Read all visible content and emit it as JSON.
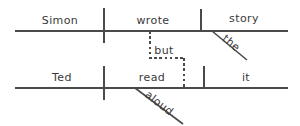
{
  "diagram": {
    "type": "reed-kellogg-sentence-diagram",
    "sentence": "Simon wrote the story but Ted read it aloud.",
    "ink_color": "#4a4a4a",
    "text_color": "#3a3a3a",
    "background_color": "#ffffff",
    "clauses": [
      {
        "id": "clause-top",
        "baseline": {
          "x1": 15,
          "x2": 288,
          "y": 31
        },
        "slots": [
          {
            "role": "subject",
            "label": "Simon",
            "x": 60,
            "y": 24
          },
          {
            "role": "verb",
            "label": "wrote",
            "x": 153,
            "y": 24
          },
          {
            "role": "direct-object",
            "label": "story",
            "x": 244,
            "y": 22
          }
        ],
        "modifiers": [
          {
            "role": "article",
            "label": "the",
            "attaches_to": "story",
            "x": 229,
            "y": 46,
            "rotation": 40
          }
        ],
        "dividers": [
          {
            "role": "subject-verb-divider",
            "x": 104,
            "y1": 8,
            "y2": 43,
            "style": "crossing"
          },
          {
            "role": "verb-object-divider",
            "x": 201,
            "y1": 9,
            "y2": 31,
            "style": "resting"
          }
        ],
        "modifier_lines": [
          {
            "role": "article-slant",
            "x1": 212,
            "y1": 31,
            "x2": 247,
            "y2": 60
          }
        ]
      },
      {
        "id": "clause-bottom",
        "baseline": {
          "x1": 15,
          "x2": 288,
          "y": 88
        },
        "slots": [
          {
            "role": "subject",
            "label": "Ted",
            "x": 62,
            "y": 81
          },
          {
            "role": "verb",
            "label": "read",
            "x": 152,
            "y": 81
          },
          {
            "role": "direct-object",
            "label": "it",
            "x": 245,
            "y": 81
          }
        ],
        "modifiers": [
          {
            "role": "adverb",
            "label": "aloud",
            "attaches_to": "read",
            "x": 155,
            "y": 106,
            "rotation": 38
          }
        ],
        "dividers": [
          {
            "role": "subject-verb-divider",
            "x": 104,
            "y1": 66,
            "y2": 100,
            "style": "crossing"
          },
          {
            "role": "verb-object-divider",
            "x": 204,
            "y1": 66,
            "y2": 88,
            "style": "resting"
          }
        ],
        "modifier_lines": [
          {
            "role": "adverb-slant",
            "x1": 135,
            "y1": 88,
            "x2": 183,
            "y2": 124
          }
        ]
      }
    ],
    "conjunction": {
      "label": "but",
      "x": 163,
      "y": 54,
      "style": "dashed",
      "path_segments": [
        {
          "role": "conjunction-upper-stem",
          "x1": 150,
          "y1": 31,
          "x2": 150,
          "y2": 58
        },
        {
          "role": "conjunction-crossbar",
          "x1": 150,
          "y1": 58,
          "x2": 184,
          "y2": 58
        },
        {
          "role": "conjunction-lower-stem",
          "x1": 184,
          "y1": 58,
          "x2": 184,
          "y2": 88
        }
      ]
    }
  }
}
